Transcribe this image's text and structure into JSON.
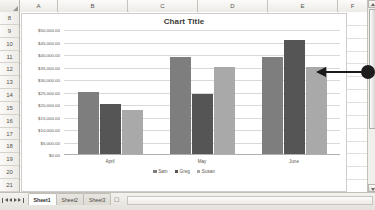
{
  "app": {
    "name": "spreadsheet-chart"
  },
  "grid": {
    "columns": [
      "A",
      "B",
      "C",
      "D",
      "E",
      "F"
    ],
    "rows": [
      "8",
      "9",
      "10",
      "11",
      "12",
      "13",
      "14",
      "15",
      "16",
      "17",
      "18",
      "19",
      "20",
      "21"
    ],
    "select_all_label": ""
  },
  "scrollbar": {
    "up_arrow": "scroll-up-arrow",
    "down_arrow": "scroll-down-arrow",
    "thumb": "scroll-thumb"
  },
  "tabbar": {
    "nav": [
      "first-sheet",
      "previous-sheet",
      "next-sheet",
      "last-sheet"
    ],
    "tabs": [
      {
        "label": "Sheet1",
        "active": true
      },
      {
        "label": "Sheet2",
        "active": false
      },
      {
        "label": "Sheet3",
        "active": false
      }
    ],
    "add_sheet_label": "➕"
  },
  "annotation": {
    "type": "cursor-pointer-arrow",
    "direction": "left"
  },
  "chart_data": {
    "type": "bar",
    "title": "Chart Title",
    "xlabel": "",
    "ylabel": "",
    "categories": [
      "April",
      "May",
      "June"
    ],
    "series": [
      {
        "name": "Sam",
        "color": "#7E7E7E",
        "values": [
          25000,
          39000,
          39000
        ]
      },
      {
        "name": "Greg",
        "color": "#555555",
        "values": [
          20000,
          24000,
          45500
        ]
      },
      {
        "name": "Susan",
        "color": "#A9A9A9",
        "values": [
          17500,
          35000,
          35000
        ]
      }
    ],
    "ylim": [
      0,
      50000
    ],
    "ytick_values": [
      0,
      5000,
      10000,
      15000,
      20000,
      25000,
      30000,
      35000,
      40000,
      45000,
      50000
    ],
    "ytick_labels": [
      "$0.00",
      "$5,000.00",
      "$10,000.00",
      "$15,000.00",
      "$20,000.00",
      "$25,000.00",
      "$30,000.00",
      "$35,000.00",
      "$40,000.00",
      "$45,000.00",
      "$50,000.00"
    ],
    "grid": true,
    "legend_position": "bottom"
  }
}
